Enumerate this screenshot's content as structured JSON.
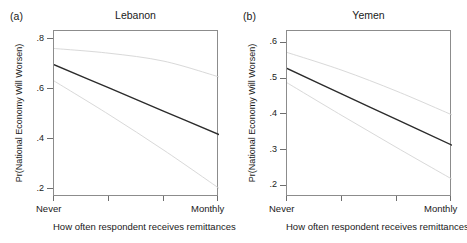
{
  "figure": {
    "xaxis_title": "How often respondent receives remittances",
    "yaxis_title": "Pr(National Economy Will Worsen)",
    "x_categories": [
      "Never",
      "Monthly"
    ],
    "line_color": "#2b2b2b",
    "ci_color": "#d9d9d9",
    "frame_color": "#8c8c8c"
  },
  "panels": [
    {
      "letter": "(a)",
      "title": "Lebanon",
      "ytick_labels": [
        ".2",
        ".4",
        ".6",
        ".8"
      ]
    },
    {
      "letter": "(b)",
      "title": "Yemen",
      "ytick_labels": [
        ".2",
        ".3",
        ".4",
        ".5",
        ".6"
      ]
    }
  ],
  "chart_data": [
    {
      "type": "line",
      "title": "Lebanon",
      "panel_letter": "(a)",
      "xlabel": "How often respondent receives remittances",
      "ylabel": "Pr(National Economy Will Worsen)",
      "x": [
        0,
        1,
        2,
        3
      ],
      "x_ticklabels": [
        "Never",
        "",
        "",
        "Monthly"
      ],
      "ylim": [
        0.17,
        0.835
      ],
      "yticks": [
        0.2,
        0.4,
        0.6,
        0.8
      ],
      "ytick_labels": [
        ".2",
        ".4",
        ".6",
        ".8"
      ],
      "grid": false,
      "legend": "none",
      "series": [
        {
          "name": "Upper 95% CI",
          "values": [
            0.765,
            0.746,
            0.714,
            0.651
          ],
          "style": "light"
        },
        {
          "name": "Predicted probability",
          "values": [
            0.7,
            0.607,
            0.513,
            0.42
          ],
          "style": "dark"
        },
        {
          "name": "Lower 95% CI",
          "values": [
            0.635,
            0.5,
            0.357,
            0.205
          ],
          "style": "light"
        }
      ]
    },
    {
      "type": "line",
      "title": "Yemen",
      "panel_letter": "(b)",
      "xlabel": "How often respondent receives remittances",
      "ylabel": "Pr(National Economy Will Worsen)",
      "x": [
        0,
        1,
        2,
        3
      ],
      "x_ticklabels": [
        "Never",
        "",
        "",
        "Monthly"
      ],
      "ylim": [
        0.17,
        0.635
      ],
      "yticks": [
        0.2,
        0.3,
        0.4,
        0.5,
        0.6
      ],
      "ytick_labels": [
        ".2",
        ".3",
        ".4",
        ".5",
        ".6"
      ],
      "grid": false,
      "legend": "none",
      "series": [
        {
          "name": "Upper 95% CI",
          "values": [
            0.575,
            0.525,
            0.466,
            0.4
          ],
          "style": "light"
        },
        {
          "name": "Predicted probability",
          "values": [
            0.53,
            0.458,
            0.387,
            0.315
          ],
          "style": "dark"
        },
        {
          "name": "Lower 95% CI",
          "values": [
            0.49,
            0.398,
            0.308,
            0.22
          ],
          "style": "light"
        }
      ]
    }
  ]
}
